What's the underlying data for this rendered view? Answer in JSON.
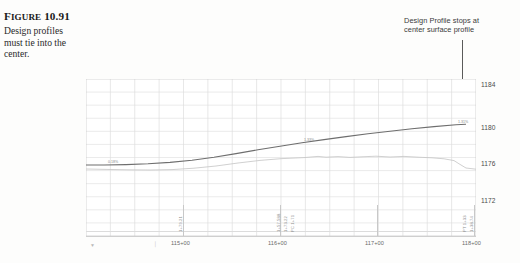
{
  "figure": {
    "label_small_caps": "IGURE",
    "label_lead": "F",
    "number": "10.91",
    "caption_lines": [
      "Design profiles",
      "must tie into the",
      "center."
    ]
  },
  "annotation": {
    "lines": [
      "Design Profile stops at",
      "center surface profile"
    ],
    "leader": "vertical-leader-line",
    "arrow": "down-arrowhead"
  },
  "chart_data": {
    "type": "line",
    "title": "",
    "xlabel": "",
    "ylabel": "",
    "ylim": [
      1170,
      1185
    ],
    "xlim": [
      0,
      390
    ],
    "grid": true,
    "legend": "none",
    "y_ticks": [
      "1184",
      "1180",
      "1176",
      "1172"
    ],
    "y_tick_px": [
      5,
      48,
      84,
      121
    ],
    "x_ticks": [
      "115+00",
      "116+00",
      "117+00",
      "118+00"
    ],
    "x_tick_px": [
      97,
      194,
      291,
      388
    ],
    "series": [
      {
        "name": "design-profile",
        "color": "#6e6e6e",
        "grade_labels": [
          "0.18%",
          "1.33%",
          "1.31%"
        ],
        "points": "0,86 18,86 40,85.6 62,84.8 84,83.4 106,81.2 128,78.2 150,74.6 172,70.8 194,67.2 216,63.8 238,60.6 260,57.6 282,54.8 304,52.2 326,49.8 348,47.6 370,45.8 380,45.2"
      },
      {
        "name": "existing-surface-profile",
        "color": "#c4c4c4",
        "points": "0,90 20,90.4 42,90.8 64,91 86,90.6 108,89.2 130,87 152,84 174,81.4 196,79.6 218,78.6 232,77.4 240,78.2 252,77.6 264,78.4 276,77.8 290,77.2 304,78 318,77.4 332,78.2 346,78.8 358,79.8 368,81.6 374,85.4 380,89 390,90.2"
      }
    ],
    "vertical_station_notes": [
      "1+79.21",
      "1+57.588",
      "1+73.22",
      "PC 1+71",
      "PT 1+33",
      "1+38.74"
    ]
  }
}
